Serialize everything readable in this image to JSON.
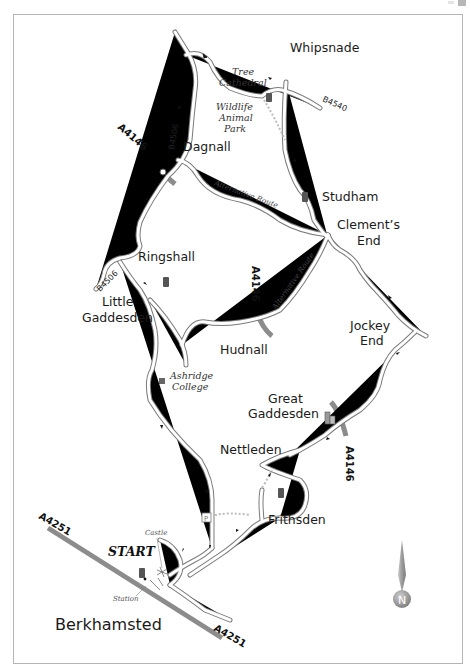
{
  "map": {
    "title": "Berkhamsted circular route map",
    "places": {
      "whipsnade": "Whipsnade",
      "dagnall": "Dagnall",
      "studham": "Studham",
      "clements_end_1": "Clement’s",
      "clements_end_2": "End",
      "ringshall": "Ringshall",
      "little_gaddesden_1": "Little",
      "little_gaddesden_2": "Gaddesden",
      "hudnall": "Hudnall",
      "jockey_end_1": "Jockey",
      "jockey_end_2": "End",
      "great_gaddesden_1": "Great",
      "great_gaddesden_2": "Gaddesden",
      "nettleden": "Nettleden",
      "frithsden": "Frithsden",
      "berkhamsted": "Berkhamsted"
    },
    "points_of_interest": {
      "tree_cathedral_1": "Tree",
      "tree_cathedral_2": "Cathedral",
      "wildlife_1": "Wildlife",
      "wildlife_2": "Animal",
      "wildlife_3": "Park",
      "ashridge_1": "Ashridge",
      "ashridge_2": "College",
      "castle": "Castle",
      "station": "Station",
      "start": "START"
    },
    "route_labels": {
      "alternative_route_1": "Alternative Route",
      "alternative_route_2": "Alternative Route"
    },
    "road_numbers": {
      "b4540": "B4540",
      "b4506_north": "B4506",
      "b4506_west": "B4506",
      "a4146_north": "A4146",
      "a4146_mid": "A4146",
      "a4146_south": "A4146",
      "a4251_west": "A4251",
      "a4251_east": "A4251"
    },
    "compass": {
      "label": "N"
    },
    "icons": [
      "pub-icon",
      "church-icon",
      "parking-icon",
      "castle-icon",
      "college-icon",
      "direction-arrow-icon",
      "compass-icon"
    ],
    "colors": {
      "road_outline": "#7a7a7a",
      "a_road": "#8c8c8c",
      "pub": "#555555",
      "compass": "#9a9a9a"
    }
  }
}
